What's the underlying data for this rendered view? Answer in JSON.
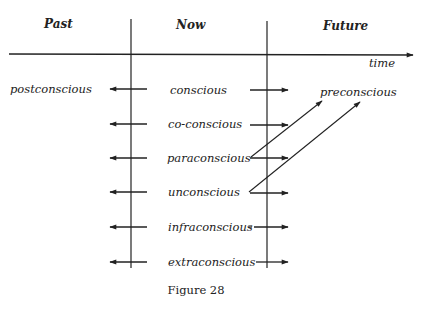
{
  "headers": {
    "past": "Past",
    "now": "Now",
    "future": "Future"
  },
  "axis_label": "time",
  "rows": [
    {
      "label": "conscious",
      "left_label": "postconscious"
    },
    {
      "label": "co-conscious"
    },
    {
      "label": "paraconscious"
    },
    {
      "label": "unconscious"
    },
    {
      "label": "infraconscious"
    },
    {
      "label": "extraconscious"
    }
  ],
  "future_label": "preconscious",
  "caption": "Figure 28",
  "colors": {
    "ink": "#222222",
    "background": "#ffffff"
  }
}
